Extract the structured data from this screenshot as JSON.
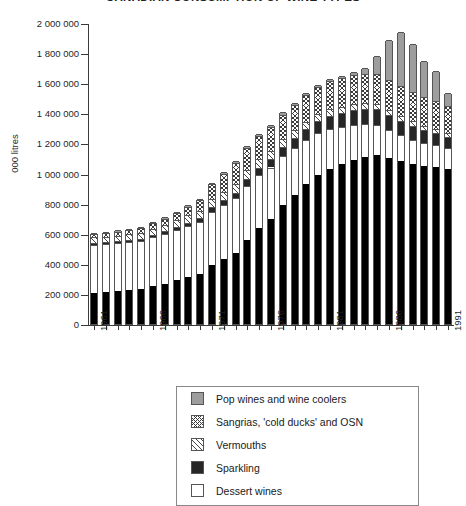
{
  "title": "CANADIAN CONSUMPTION OF WINE TYPES",
  "axes": {
    "y_title": "000  litres",
    "y_ticks": [
      "2 000 000",
      "1 800 000",
      "1 600 000",
      "1 400 000",
      "1 200 000",
      "1 000 000",
      "800 000",
      "600 000",
      "400 000",
      "200 000",
      "0"
    ],
    "y_tick_values": [
      2000000,
      1800000,
      1600000,
      1400000,
      1200000,
      1000000,
      800000,
      600000,
      400000,
      200000,
      0
    ],
    "x_labels": [
      "1961",
      "1966",
      "1971",
      "1976",
      "1981",
      "1986",
      "1991"
    ],
    "x_label_years": [
      1961,
      1966,
      1971,
      1976,
      1981,
      1986,
      1991
    ]
  },
  "legend": {
    "items": [
      {
        "label": "Pop wines and wine coolers",
        "swatch": "stipple-gray"
      },
      {
        "label": "Sangrias, 'cold ducks' and OSN",
        "swatch": "cross-hatch"
      },
      {
        "label": "Vermouths",
        "swatch": "diagonal-hatch"
      },
      {
        "label": "Sparkling",
        "swatch": "solid-black"
      },
      {
        "label": "Dessert wines",
        "swatch": "white"
      }
    ]
  },
  "chart_data": {
    "type": "bar",
    "stacked": true,
    "title": "CANADIAN CONSUMPTION OF WINE TYPES",
    "xlabel": "",
    "ylabel": "000  litres",
    "ylim": [
      0,
      2000000
    ],
    "ytick_step": 200000,
    "grid": false,
    "legend_position": "below-plot",
    "categories": [
      "1961",
      "1962",
      "1963",
      "1964",
      "1965",
      "1966",
      "1967",
      "1968",
      "1969",
      "1970",
      "1971",
      "1972",
      "1973",
      "1974",
      "1975",
      "1976",
      "1977",
      "1978",
      "1979",
      "1980",
      "1981",
      "1982",
      "1983",
      "1984",
      "1985",
      "1986",
      "1987",
      "1988",
      "1989",
      "1990",
      "1991"
    ],
    "series": [
      {
        "name": "Table wines",
        "swatch": "solid-black",
        "note": "bottom-most stack layer; legend entry clipped below visible area",
        "values": [
          205000,
          210000,
          218000,
          225000,
          232000,
          250000,
          268000,
          290000,
          312000,
          332000,
          390000,
          430000,
          470000,
          560000,
          640000,
          700000,
          790000,
          860000,
          930000,
          990000,
          1030000,
          1060000,
          1090000,
          1110000,
          1120000,
          1100000,
          1080000,
          1060000,
          1050000,
          1040000,
          1030000
        ]
      },
      {
        "name": "Dessert wines",
        "swatch": "white",
        "values": [
          320000,
          320000,
          318000,
          318000,
          320000,
          325000,
          330000,
          335000,
          340000,
          348000,
          355000,
          360000,
          365000,
          360000,
          350000,
          340000,
          325000,
          310000,
          295000,
          280000,
          265000,
          250000,
          235000,
          220000,
          205000,
          190000,
          175000,
          165000,
          155000,
          150000,
          140000
        ]
      },
      {
        "name": "Sparkling",
        "swatch": "solid-black",
        "values": [
          14000,
          14000,
          15000,
          15000,
          16000,
          17000,
          18000,
          20000,
          22000,
          24000,
          30000,
          34000,
          38000,
          44000,
          48000,
          54000,
          60000,
          66000,
          72000,
          80000,
          88000,
          92000,
          96000,
          100000,
          102000,
          100000,
          96000,
          92000,
          86000,
          80000,
          74000
        ]
      },
      {
        "name": "Vermouths",
        "swatch": "diagonal-hatch",
        "values": [
          36000,
          36000,
          37000,
          38000,
          40000,
          42000,
          44000,
          46000,
          48000,
          50000,
          54000,
          56000,
          58000,
          58000,
          56000,
          54000,
          52000,
          50000,
          48000,
          46000,
          44000,
          42000,
          40000,
          38000,
          36000,
          34000,
          32000,
          30000,
          28000,
          26000,
          24000
        ]
      },
      {
        "name": "Sangrias, 'cold ducks' and OSN",
        "swatch": "cross-hatch",
        "values": [
          22000,
          24000,
          26000,
          28000,
          30000,
          34000,
          40000,
          48000,
          58000,
          70000,
          100000,
          120000,
          140000,
          150000,
          156000,
          160000,
          165000,
          170000,
          175000,
          180000,
          186000,
          190000,
          194000,
          196000,
          198000,
          200000,
          200000,
          196000,
          190000,
          186000,
          180000
        ]
      },
      {
        "name": "Pop wines and wine coolers",
        "swatch": "stipple-gray",
        "values": [
          8000,
          8000,
          8000,
          8000,
          8000,
          8000,
          8000,
          8000,
          8000,
          8000,
          8000,
          10000,
          12000,
          14000,
          14000,
          14000,
          14000,
          14000,
          14000,
          14000,
          14000,
          16000,
          20000,
          40000,
          120000,
          260000,
          360000,
          320000,
          240000,
          200000,
          90000
        ]
      }
    ],
    "totals": [
      605000,
      612000,
      622000,
      632000,
      646000,
      676000,
      708000,
      747000,
      788000,
      832000,
      937000,
      1010000,
      1083000,
      1186000,
      1264000,
      1322000,
      1406000,
      1470000,
      1534000,
      1590000,
      1627000,
      1650000,
      1675000,
      1704000,
      1781000,
      1884000,
      1943000,
      1863000,
      1749000,
      1682000,
      1538000
    ]
  }
}
